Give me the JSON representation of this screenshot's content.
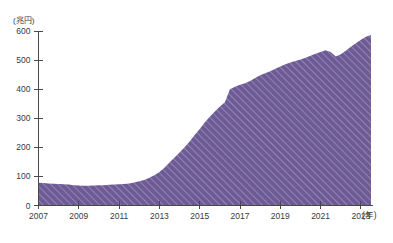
{
  "chart_data": {
    "type": "area",
    "title": "",
    "subtitle": "",
    "xlabel": "(年)",
    "ylabel": "(兆円)",
    "ylim": [
      0,
      600
    ],
    "xlim": [
      2007,
      2023.6
    ],
    "grid": false,
    "legend": null,
    "y_ticks": [
      0,
      100,
      200,
      300,
      400,
      500,
      600
    ],
    "y_tick_labels": [
      "0",
      "100",
      "200",
      "300",
      "400",
      "500",
      "600"
    ],
    "x_ticks": [
      2007,
      2009,
      2011,
      2013,
      2015,
      2017,
      2019,
      2021,
      2023
    ],
    "x_tick_labels": [
      "2007",
      "2009",
      "2011",
      "2013",
      "2015",
      "2017",
      "2019",
      "2021",
      "2023"
    ],
    "series_name": "残高",
    "fill_color": "#6e5b96",
    "hatch": "diagonal-forward",
    "hatch_color": "#9a8ab8",
    "x": [
      2007.0,
      2007.25,
      2007.5,
      2007.75,
      2008.0,
      2008.25,
      2008.5,
      2008.75,
      2009.0,
      2009.25,
      2009.5,
      2009.75,
      2010.0,
      2010.25,
      2010.5,
      2010.75,
      2011.0,
      2011.25,
      2011.5,
      2011.75,
      2012.0,
      2012.25,
      2012.5,
      2012.75,
      2013.0,
      2013.25,
      2013.5,
      2013.75,
      2014.0,
      2014.25,
      2014.5,
      2014.75,
      2015.0,
      2015.25,
      2015.5,
      2015.75,
      2016.0,
      2016.25,
      2016.5,
      2016.75,
      2017.0,
      2017.25,
      2017.5,
      2017.75,
      2018.0,
      2018.25,
      2018.5,
      2018.75,
      2019.0,
      2019.25,
      2019.5,
      2019.75,
      2020.0,
      2020.25,
      2020.5,
      2020.75,
      2021.0,
      2021.25,
      2021.5,
      2021.75,
      2022.0,
      2022.25,
      2022.5,
      2022.75,
      2023.0,
      2023.25,
      2023.5
    ],
    "values": [
      78,
      77,
      76,
      75,
      74,
      73,
      72,
      70,
      69,
      68,
      68,
      69,
      70,
      70,
      71,
      72,
      73,
      74,
      76,
      79,
      83,
      88,
      95,
      104,
      115,
      130,
      148,
      165,
      182,
      200,
      220,
      242,
      263,
      285,
      305,
      323,
      340,
      355,
      400,
      408,
      415,
      420,
      428,
      438,
      448,
      455,
      462,
      470,
      478,
      486,
      492,
      497,
      502,
      508,
      515,
      522,
      528,
      534,
      528,
      512,
      520,
      532,
      546,
      558,
      570,
      580,
      586
    ],
    "annotations": []
  }
}
